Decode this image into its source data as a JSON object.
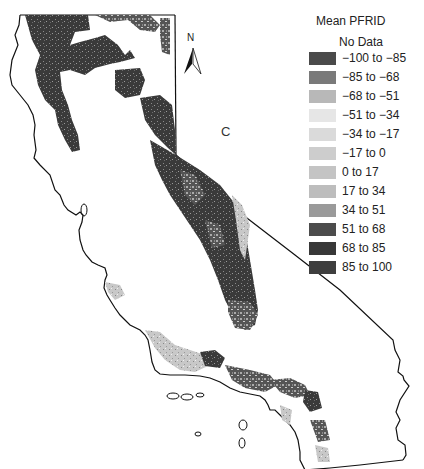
{
  "map": {
    "panel_label": "C",
    "north_arrow": {
      "label": "N",
      "icon": "north-arrow-icon"
    },
    "region": "California",
    "coastline_color": "#111111"
  },
  "legend": {
    "title": "Mean PFRID",
    "no_data_label": "No Data",
    "items": [
      {
        "label": "−100 to −85",
        "color": "#4a4a4a"
      },
      {
        "label": "−85 to −68",
        "color": "#7a7a7a"
      },
      {
        "label": "−68 to −51",
        "color": "#b8b8b8"
      },
      {
        "label": "−51 to −34",
        "color": "#e6e6e6"
      },
      {
        "label": "−34 to −17",
        "color": "#dadada"
      },
      {
        "label": "−17 to 0",
        "color": "#cdcdcd"
      },
      {
        "label": "0 to 17",
        "color": "#c4c4c4"
      },
      {
        "label": "17 to 34",
        "color": "#bdbdbd"
      },
      {
        "label": "34 to 51",
        "color": "#9a9a9a"
      },
      {
        "label": "51 to 68",
        "color": "#4c4c4c"
      },
      {
        "label": "68 to 85",
        "color": "#383838"
      },
      {
        "label": "85 to 100",
        "color": "#3e3e3e"
      }
    ]
  }
}
